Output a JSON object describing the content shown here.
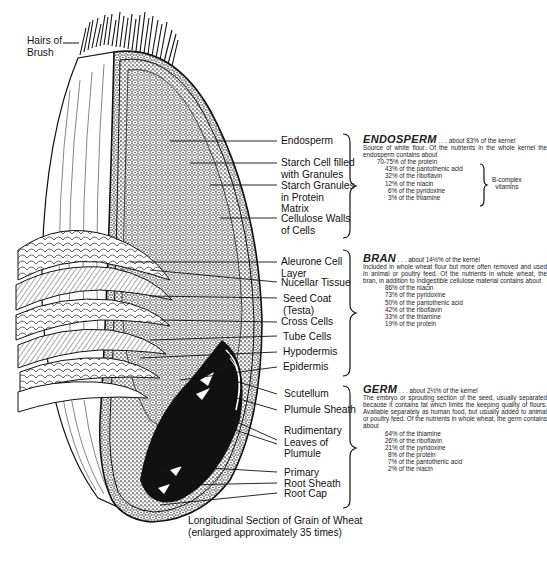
{
  "diagram": {
    "title": "Longitudinal Section of Grain of Wheat",
    "subtitle": "(enlarged approximately 35 times)",
    "top_label": "Hairs of Brush",
    "top_label_lines": [
      "Hairs of",
      "Brush"
    ],
    "endosperm_labels": [
      {
        "lines": [
          "Endosperm"
        ]
      },
      {
        "lines": [
          "Starch Cell filled",
          "with Granules"
        ]
      },
      {
        "lines": [
          "Starch Granules",
          "in Protein",
          "Matrix"
        ]
      },
      {
        "lines": [
          "Cellulose Walls",
          "of Cells"
        ]
      }
    ],
    "bran_labels": [
      {
        "lines": [
          "Aleurone Cell",
          "Layer"
        ]
      },
      {
        "lines": [
          "Nucellar Tissue"
        ]
      },
      {
        "lines": [
          "Seed Coat",
          "(Testa)"
        ]
      },
      {
        "lines": [
          "Cross Cells"
        ]
      },
      {
        "lines": [
          "Tube Cells"
        ]
      },
      {
        "lines": [
          "Hypodermis"
        ]
      },
      {
        "lines": [
          "Epidermis"
        ]
      }
    ],
    "germ_labels": [
      {
        "lines": [
          "Scutellum"
        ]
      },
      {
        "lines": [
          "Plumule Sheath"
        ]
      },
      {
        "lines": [
          "Rudimentary",
          "Leaves of",
          "Plumule"
        ]
      },
      {
        "lines": [
          "Primary"
        ]
      },
      {
        "lines": [
          "Root Sheath"
        ]
      },
      {
        "lines": [
          "Root Cap"
        ]
      }
    ]
  },
  "sections": {
    "endosperm": {
      "heading": "ENDOSPERM",
      "lead": ". . . about 83% of the kernel",
      "body": "Source of white flour. Of the nutrients in the whole kernel the endosperm contains about",
      "items": [
        "70-75% of the protein",
        "43% of the pantothenic acid",
        "32% of the riboflavin",
        "12% of the niacin",
        "6% of the pyridoxine",
        "3% of the thiamine"
      ],
      "bracket_note_lines": [
        "B-complex",
        "vitamins"
      ]
    },
    "bran": {
      "heading": "BRAN",
      "lead": ". . . about 14½% of the kernel",
      "body": "Included in whole wheat flour but more often removed and used in animal or poultry feed. Of the nutrients in whole wheat, the bran, in addition to indigestible cellulose material contains about",
      "items": [
        "86% of the niacin",
        "73% of the pyridoxine",
        "50% of the pantothenic acid",
        "42% of the riboflavin",
        "33% of the thiamine",
        "19% of the protein"
      ]
    },
    "germ": {
      "heading": "GERM",
      "lead": ". . . about 2½% of the kernel",
      "body": "The embryo or sprouting section of the seed, usually separated because it contains fat which limits the keeping quality of flours. Available separately as human food, but usually added to animal or poultry feed. Of the nutrients in whole wheat, the germ contains about",
      "items": [
        "64% of the thiamine",
        "26% of the riboflavin",
        "21% of the pyridoxine",
        "8% of the protein",
        "7% of the pantothenic acid",
        "2% of the niacin"
      ]
    }
  }
}
